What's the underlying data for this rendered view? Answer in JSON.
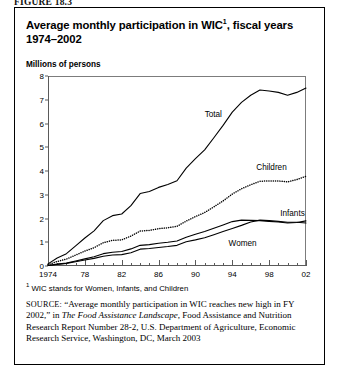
{
  "figure": {
    "label": "FIGURE 18.3",
    "title_line1": "Average monthly participation in WIC",
    "title_sup": "1",
    "title_line1_tail": ", fiscal years",
    "title_line2": "1974–2002",
    "axis_caption": "Millions of persons",
    "footnote_marker": "1",
    "footnote_text": "WIC stands for Women, Infants, and Children",
    "source_prefix": "SOURCE:",
    "source_quote": "“Average monthly participation in WIC reaches new high in FY 2002,” in ",
    "source_italic": "The Food Assistance Landscape",
    "source_rest": ", Food Assistance and Nutrition Research Report Number 28-2, U.S. Department of Agriculture, Economic Research Service, Washington, DC, March 2003"
  },
  "chart_data": {
    "type": "line",
    "xlabel": "",
    "ylabel": "Millions of persons",
    "xlim": [
      1974,
      2002
    ],
    "ylim": [
      0,
      8
    ],
    "grid": false,
    "legend": "inline-labels",
    "ytick_values": [
      0,
      1,
      2,
      3,
      4,
      5,
      6,
      7,
      8
    ],
    "ytick_labels": [
      "0",
      "1",
      "2",
      "3",
      "4",
      "5",
      "6",
      "7",
      "8"
    ],
    "xtick_major_values": [
      1974,
      1978,
      1982,
      1986,
      1990,
      1994,
      1998,
      2002
    ],
    "xtick_major_labels": [
      "1974",
      "78",
      "82",
      "86",
      "90",
      "94",
      "98",
      "02"
    ],
    "x": [
      1974,
      1975,
      1976,
      1977,
      1978,
      1979,
      1980,
      1981,
      1982,
      1983,
      1984,
      1985,
      1986,
      1987,
      1988,
      1989,
      1990,
      1991,
      1992,
      1993,
      1994,
      1995,
      1996,
      1997,
      1998,
      1999,
      2000,
      2001,
      2002
    ],
    "series": [
      {
        "name": "Total",
        "style": "solid",
        "color": "#000000",
        "values": [
          0.09,
          0.34,
          0.52,
          0.85,
          1.18,
          1.48,
          1.91,
          2.12,
          2.19,
          2.54,
          3.05,
          3.14,
          3.31,
          3.43,
          3.59,
          4.12,
          4.52,
          4.89,
          5.4,
          5.92,
          6.48,
          6.89,
          7.19,
          7.41,
          7.37,
          7.31,
          7.19,
          7.31,
          7.49
        ]
      },
      {
        "name": "Children",
        "style": "dotted",
        "color": "#000000",
        "values": [
          0.05,
          0.19,
          0.29,
          0.46,
          0.63,
          0.77,
          0.98,
          1.08,
          1.1,
          1.26,
          1.47,
          1.5,
          1.57,
          1.61,
          1.67,
          1.89,
          2.08,
          2.25,
          2.49,
          2.74,
          3.03,
          3.25,
          3.42,
          3.57,
          3.58,
          3.58,
          3.54,
          3.64,
          3.78
        ]
      },
      {
        "name": "Infants",
        "style": "solid",
        "color": "#000000",
        "values": [
          0.02,
          0.08,
          0.12,
          0.21,
          0.3,
          0.39,
          0.52,
          0.58,
          0.61,
          0.72,
          0.87,
          0.9,
          0.96,
          1.0,
          1.05,
          1.21,
          1.34,
          1.45,
          1.59,
          1.73,
          1.87,
          1.93,
          1.92,
          1.91,
          1.88,
          1.85,
          1.81,
          1.83,
          1.9
        ]
      },
      {
        "name": "Women",
        "style": "solid",
        "color": "#000000",
        "values": [
          0.02,
          0.07,
          0.11,
          0.18,
          0.25,
          0.32,
          0.41,
          0.46,
          0.48,
          0.56,
          0.71,
          0.74,
          0.78,
          0.82,
          0.87,
          1.02,
          1.1,
          1.19,
          1.32,
          1.45,
          1.58,
          1.71,
          1.85,
          1.93,
          1.91,
          1.88,
          1.84,
          1.84,
          1.81
        ]
      }
    ],
    "annotations": [
      {
        "text": "Total",
        "x": 1991.0,
        "y": 6.55
      },
      {
        "text": "Children",
        "x": 1996.6,
        "y": 4.35
      },
      {
        "text": "Infants",
        "x": 1999.2,
        "y": 2.42
      },
      {
        "text": "Women",
        "x": 1993.6,
        "y": 1.12
      }
    ]
  }
}
